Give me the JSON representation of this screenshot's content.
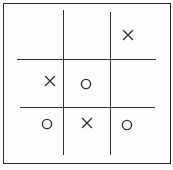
{
  "diagram": {
    "colors": {
      "ink": "#333333",
      "frame": "#2a2a2a",
      "background": "#ffffff"
    },
    "grid": {
      "rows": 3,
      "cols": 3
    },
    "cells": [
      [
        "",
        "",
        "X"
      ],
      [
        "X",
        "O",
        ""
      ],
      [
        "O",
        "X",
        "O"
      ]
    ],
    "marks": [
      {
        "row": 0,
        "col": 2,
        "symbol": "X",
        "x": 128,
        "y": 35
      },
      {
        "row": 1,
        "col": 0,
        "symbol": "X",
        "x": 50,
        "y": 81
      },
      {
        "row": 1,
        "col": 1,
        "symbol": "O",
        "x": 86,
        "y": 84
      },
      {
        "row": 2,
        "col": 0,
        "symbol": "O",
        "x": 47,
        "y": 124
      },
      {
        "row": 2,
        "col": 1,
        "symbol": "X",
        "x": 87,
        "y": 123
      },
      {
        "row": 2,
        "col": 2,
        "symbol": "O",
        "x": 127,
        "y": 125
      }
    ]
  }
}
